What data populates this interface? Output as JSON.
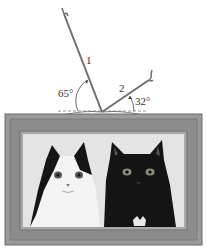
{
  "diagram": {
    "cords": [
      {
        "label": "1",
        "angle_label": "65°",
        "angle_deg": 65
      },
      {
        "label": "2",
        "angle_label": "32°",
        "angle_deg": 32
      }
    ],
    "reference": "horizontal dashed line",
    "picture": {
      "subject": "two cats (black-and-white cat, black cat)",
      "frame_color": "#8c8c8c",
      "mat_color": "#a8a8a8"
    },
    "colors": {
      "cord": "#6f6f6f",
      "frame_outer": "#9a9a9a",
      "frame_inner": "#7f7f7f",
      "text": "#333333"
    }
  }
}
